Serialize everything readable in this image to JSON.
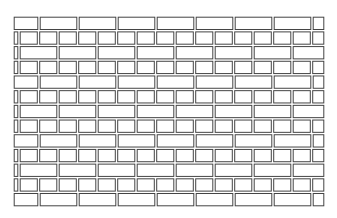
{
  "figure": {
    "stroke_color": "#444444",
    "fill_color": "#ffffff",
    "wall": {
      "x0": 13,
      "x1": 325,
      "y0": 16,
      "y1": 207
    },
    "rows": 13,
    "long_brick_width": 39,
    "short_brick_width": 19.5,
    "row_pattern": [
      "long",
      "short"
    ]
  }
}
